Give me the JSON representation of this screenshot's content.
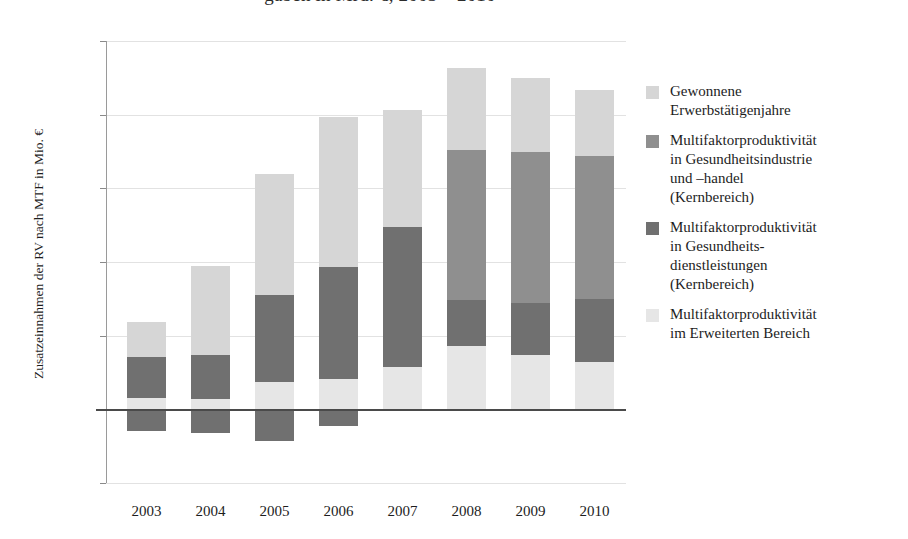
{
  "title": "gaben in Mrd. €, 2003 – 2010",
  "axes": {
    "y_title": "Zusatzeinnahmen der RV nach MTF in Mio. €",
    "y_ticks": [
      "2.500",
      "2.000",
      "1.500",
      "1.000",
      "500",
      "0",
      "-500"
    ],
    "x_ticks": [
      "2003",
      "2004",
      "2005",
      "2006",
      "2007",
      "2008",
      "2009",
      "2010"
    ]
  },
  "colors": {
    "gewonnene_erwerbstaetigenjahre": "#d6d6d6",
    "mfp_gesundheitsindustrie": "#8f8f8f",
    "mfp_gesundheitsdienstleistungen": "#707070",
    "mfp_erweiterter_bereich": "#e6e6e6",
    "gridline": "#e2e2e2",
    "zero_line": "#4a4a4a",
    "axis": "#9a9a9a",
    "text": "#1d1d1d",
    "background": "#ffffff"
  },
  "legend": {
    "items": [
      {
        "label": "Gewonnene\nErwerbstätigenjahre",
        "color_key": "gewonnene_erwerbstaetigenjahre",
        "color": "#d6d6d6"
      },
      {
        "label": "Multifaktorproduktivität\nin Gesundheitsindustrie\nund –handel\n(Kernbereich)",
        "color_key": "mfp_gesundheitsindustrie",
        "color": "#8f8f8f"
      },
      {
        "label": "Multifaktorproduktivität\nin Gesundheits-\ndienstleistungen\n(Kernbereich)",
        "color_key": "mfp_gesundheitsdienstleistungen",
        "color": "#707070"
      },
      {
        "label": "Multifaktorproduktivität\nim Erweiterten Bereich",
        "color_key": "mfp_erweiterter_bereich",
        "color": "#e6e6e6"
      }
    ]
  },
  "chart_data": {
    "type": "bar",
    "subtype": "stacked-with-negatives",
    "title": "gaben in Mrd. €, 2003 – 2010",
    "xlabel": "",
    "ylabel": "Zusatzeinnahmen der RV nach MTF in Mio. €",
    "ylim": [
      -500,
      2500
    ],
    "ytick_values": [
      2500,
      2000,
      1500,
      1000,
      500,
      0,
      -500
    ],
    "grid": true,
    "legend_position": "right",
    "categories": [
      "2003",
      "2004",
      "2005",
      "2006",
      "2007",
      "2008",
      "2009",
      "2010"
    ],
    "series": [
      {
        "name": "Multifaktorproduktivität im Erweiterten Bereich",
        "color": "#e6e6e6",
        "note": "Lowest positive stack segment; also the negative segment shown below the zero line is drawn in the darker Gesundheitsdienstleistungen grey.",
        "values": [
          75,
          70,
          185,
          205,
          290,
          430,
          370,
          320
        ]
      },
      {
        "name": "Multifaktorproduktivität in Gesundheitsdienstleistungen (Kernbereich)",
        "color": "#707070",
        "values": [
          280,
          300,
          590,
          760,
          950,
          315,
          350,
          430
        ]
      },
      {
        "name": "Multifaktorproduktivität in Gesundheitsindustrie und –handel (Kernbereich)",
        "color": "#8f8f8f",
        "values": [
          0,
          0,
          0,
          0,
          0,
          1015,
          1025,
          970
        ]
      },
      {
        "name": "Gewonnene Erwerbstätigenjahre",
        "color": "#d6d6d6",
        "values": [
          240,
          605,
          825,
          1020,
          795,
          560,
          505,
          445
        ]
      },
      {
        "name": "Negativer Anteil (unter der Nulllinie)",
        "color": "#707070",
        "values": [
          -150,
          -160,
          -215,
          -115,
          0,
          0,
          0,
          0
        ]
      }
    ],
    "stack_totals": [
      595,
      975,
      1600,
      1985,
      2035,
      2320,
      2250,
      2165
    ]
  },
  "bars": [
    {
      "year": "2003",
      "x": 21,
      "width": 39,
      "segments": [
        {
          "name": "erweiterter",
          "from": 0,
          "to": 75,
          "color": "#e6e6e6"
        },
        {
          "name": "dienstleistungen",
          "from": 75,
          "to": 355,
          "color": "#707070"
        },
        {
          "name": "erwerbstaetigenjahre",
          "from": 355,
          "to": 595,
          "color": "#d6d6d6"
        },
        {
          "name": "negativ",
          "from": -150,
          "to": 0,
          "color": "#707070"
        }
      ]
    },
    {
      "year": "2004",
      "x": 85,
      "width": 39,
      "segments": [
        {
          "name": "erweiterter",
          "from": 0,
          "to": 70,
          "color": "#e6e6e6"
        },
        {
          "name": "dienstleistungen",
          "from": 70,
          "to": 370,
          "color": "#707070"
        },
        {
          "name": "erwerbstaetigenjahre",
          "from": 370,
          "to": 975,
          "color": "#d6d6d6"
        },
        {
          "name": "negativ",
          "from": -160,
          "to": 0,
          "color": "#707070"
        }
      ]
    },
    {
      "year": "2005",
      "x": 149,
      "width": 39,
      "segments": [
        {
          "name": "erweiterter",
          "from": 0,
          "to": 185,
          "color": "#e6e6e6"
        },
        {
          "name": "dienstleistungen",
          "from": 185,
          "to": 775,
          "color": "#707070"
        },
        {
          "name": "erwerbstaetigenjahre",
          "from": 775,
          "to": 1600,
          "color": "#d6d6d6"
        },
        {
          "name": "negativ",
          "from": -215,
          "to": 0,
          "color": "#707070"
        }
      ]
    },
    {
      "year": "2006",
      "x": 213,
      "width": 39,
      "segments": [
        {
          "name": "erweiterter",
          "from": 0,
          "to": 205,
          "color": "#e6e6e6"
        },
        {
          "name": "dienstleistungen",
          "from": 205,
          "to": 965,
          "color": "#707070"
        },
        {
          "name": "erwerbstaetigenjahre",
          "from": 965,
          "to": 1985,
          "color": "#d6d6d6"
        },
        {
          "name": "negativ",
          "from": -115,
          "to": 0,
          "color": "#707070"
        }
      ]
    },
    {
      "year": "2007",
      "x": 277,
      "width": 39,
      "segments": [
        {
          "name": "erweiterter",
          "from": 0,
          "to": 290,
          "color": "#e6e6e6"
        },
        {
          "name": "dienstleistungen",
          "from": 290,
          "to": 1240,
          "color": "#707070"
        },
        {
          "name": "erwerbstaetigenjahre",
          "from": 1240,
          "to": 2035,
          "color": "#d6d6d6"
        }
      ]
    },
    {
      "year": "2008",
      "x": 341,
      "width": 39,
      "segments": [
        {
          "name": "erweiterter",
          "from": 0,
          "to": 430,
          "color": "#e6e6e6"
        },
        {
          "name": "dienstleistungen",
          "from": 430,
          "to": 745,
          "color": "#707070"
        },
        {
          "name": "industrie",
          "from": 745,
          "to": 1760,
          "color": "#8f8f8f"
        },
        {
          "name": "erwerbstaetigenjahre",
          "from": 1760,
          "to": 2320,
          "color": "#d6d6d6"
        }
      ]
    },
    {
      "year": "2009",
      "x": 405,
      "width": 39,
      "segments": [
        {
          "name": "erweiterter",
          "from": 0,
          "to": 370,
          "color": "#e6e6e6"
        },
        {
          "name": "dienstleistungen",
          "from": 370,
          "to": 720,
          "color": "#707070"
        },
        {
          "name": "industrie",
          "from": 720,
          "to": 1745,
          "color": "#8f8f8f"
        },
        {
          "name": "erwerbstaetigenjahre",
          "from": 1745,
          "to": 2250,
          "color": "#d6d6d6"
        }
      ]
    },
    {
      "year": "2010",
      "x": 469,
      "width": 39,
      "segments": [
        {
          "name": "erweiterter",
          "from": 0,
          "to": 320,
          "color": "#e6e6e6"
        },
        {
          "name": "dienstleistungen",
          "from": 320,
          "to": 750,
          "color": "#707070"
        },
        {
          "name": "industrie",
          "from": 750,
          "to": 1720,
          "color": "#8f8f8f"
        },
        {
          "name": "erwerbstaetigenjahre",
          "from": 1720,
          "to": 2165,
          "color": "#d6d6d6"
        }
      ]
    }
  ]
}
